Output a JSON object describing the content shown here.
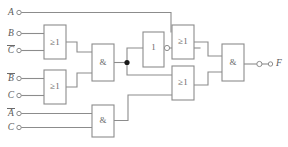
{
  "figure": {
    "kind": "logic-circuit-diagram",
    "width": 288,
    "height": 147,
    "background_color": "#ffffff",
    "wire_color": "#8c8c8c",
    "label_color": "#5a5a5a",
    "junction_color": "#1a1a1a"
  },
  "inputs": [
    {
      "id": "in-a",
      "label": "A",
      "overbar": false,
      "x": 40,
      "y": 38
    },
    {
      "id": "in-b",
      "label": "B",
      "overbar": false,
      "x": 40,
      "y": 100
    },
    {
      "id": "in-cbar",
      "label": "C",
      "overbar": true,
      "x": 40,
      "y": 152
    },
    {
      "id": "in-bbar",
      "label": "B",
      "overbar": true,
      "x": 40,
      "y": 236
    },
    {
      "id": "in-c2",
      "label": "C",
      "overbar": false,
      "x": 40,
      "y": 286
    },
    {
      "id": "in-abar",
      "label": "A",
      "overbar": true,
      "x": 40,
      "y": 340
    },
    {
      "id": "in-c3",
      "label": "C",
      "overbar": false,
      "x": 40,
      "y": 381
    }
  ],
  "outputs": [
    {
      "id": "out-f",
      "label": "F",
      "overbar": false
    }
  ],
  "gates": [
    {
      "id": "or-1",
      "type": "OR",
      "label": "≥1",
      "role": "or-gate-top-left"
    },
    {
      "id": "or-2",
      "type": "OR",
      "label": "≥1",
      "role": "or-gate-mid-left"
    },
    {
      "id": "and-1",
      "type": "AND",
      "label": "&",
      "role": "and-gate-left"
    },
    {
      "id": "and-2",
      "type": "AND",
      "label": "&",
      "role": "and-gate-bottom"
    },
    {
      "id": "not-1",
      "type": "NOT",
      "label": "1",
      "role": "inverter",
      "inverted_output": true
    },
    {
      "id": "or-3",
      "type": "OR",
      "label": "≥1",
      "role": "or-gate-top-right"
    },
    {
      "id": "or-4",
      "type": "OR",
      "label": "≥1",
      "role": "or-gate-bottom-right"
    },
    {
      "id": "and-3",
      "type": "AND",
      "label": "&",
      "role": "and-gate-output",
      "inverted_output": true
    }
  ],
  "nets": [
    {
      "from": "in-a",
      "to": "or-3.in1"
    },
    {
      "from": "in-b",
      "to": "or-1.in1"
    },
    {
      "from": "in-cbar",
      "to": "or-1.in2"
    },
    {
      "from": "in-bbar",
      "to": "or-2.in1"
    },
    {
      "from": "in-c2",
      "to": "or-2.in2"
    },
    {
      "from": "in-abar",
      "to": "and-2.in1"
    },
    {
      "from": "in-c3",
      "to": "and-2.in2"
    },
    {
      "from": "or-1.out",
      "to": "and-1.in1"
    },
    {
      "from": "or-2.out",
      "to": "and-1.in2"
    },
    {
      "from": "and-1.out",
      "to": "junction-1"
    },
    {
      "from": "junction-1",
      "to": "not-1.in"
    },
    {
      "from": "junction-1",
      "to": "or-4.in1"
    },
    {
      "from": "not-1.out",
      "to": "or-3.in2"
    },
    {
      "from": "and-2.out",
      "to": "or-4.in2"
    },
    {
      "from": "or-3.out",
      "to": "and-3.in1"
    },
    {
      "from": "or-4.out",
      "to": "and-3.in2"
    },
    {
      "from": "and-3.out",
      "to": "out-f"
    }
  ]
}
